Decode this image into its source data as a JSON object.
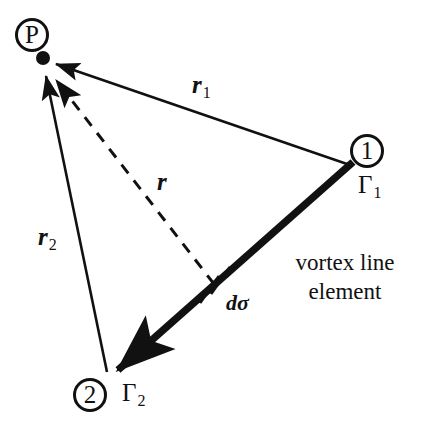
{
  "figure": {
    "background_color": "#ffffff",
    "stroke_color": "#111111",
    "width": 424,
    "height": 423
  },
  "nodes": {
    "field_point": {
      "circle_label": "P",
      "marker": "filled-dot",
      "cx": 32,
      "cy": 35,
      "dot_x": 43,
      "dot_y": 58
    },
    "endpoint_1": {
      "circle_label": "1",
      "circulation_label": "Γ",
      "circulation_subscript": "1",
      "cx": 367,
      "cy": 151
    },
    "endpoint_2": {
      "circle_label": "2",
      "circulation_label": "Γ",
      "circulation_subscript": "2",
      "cx": 90,
      "cy": 395
    }
  },
  "vectors": {
    "r1": {
      "symbol": "r",
      "subscript": "1",
      "style": "solid",
      "from": "endpoint_1",
      "to": "field_point",
      "label_x": 192,
      "label_y": 72
    },
    "r2": {
      "symbol": "r",
      "subscript": "2",
      "style": "solid",
      "from": "endpoint_2",
      "to": "field_point",
      "label_x": 38,
      "label_y": 224
    },
    "r": {
      "symbol": "r",
      "subscript": "",
      "style": "dashed",
      "from": "line_element",
      "to": "field_point",
      "label_x": 157,
      "label_y": 169
    }
  },
  "line_element": {
    "label": "dσ",
    "label_x": 226,
    "label_y": 292,
    "tick_x": 215,
    "tick_y": 283
  },
  "vortex_line": {
    "caption_line_1": "vortex line",
    "caption_line_2": "element",
    "caption_x": 345,
    "caption_y": 248,
    "style": "thick-solid-arrow",
    "from_x": 352,
    "from_y": 163,
    "to_x": 112,
    "to_y": 374
  }
}
